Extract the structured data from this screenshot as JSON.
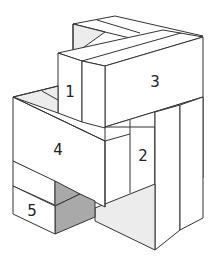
{
  "diagram": {
    "type": "isometric block assembly",
    "labels": {
      "block_1": "1",
      "block_2": "2",
      "block_3": "3",
      "block_4": "4",
      "block_5": "5"
    },
    "colors": {
      "outline": "#333333",
      "face_white": "#ffffff",
      "face_light_gray": "#ececec",
      "face_dark_gray": "#a9a9a9",
      "background": "#ffffff"
    }
  }
}
